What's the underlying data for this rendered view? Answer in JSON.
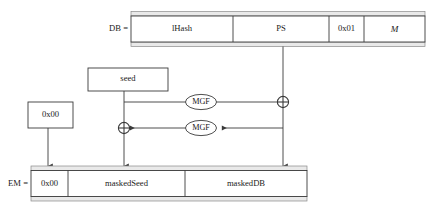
{
  "diagram": {
    "db_label": "DB =",
    "em_label": "EM =",
    "db_segments": [
      {
        "name": "lhash",
        "label": "lHash",
        "italic": false
      },
      {
        "name": "ps",
        "label": "PS",
        "italic": false
      },
      {
        "name": "byte01",
        "label": "0x01",
        "italic": false
      },
      {
        "name": "message",
        "label": "M",
        "italic": true
      }
    ],
    "em_segments": [
      {
        "name": "byte00",
        "label": "0x00",
        "italic": false
      },
      {
        "name": "maskedseed",
        "label": "maskedSeed",
        "italic": false
      },
      {
        "name": "maskeddb",
        "label": "maskedDB",
        "italic": false
      }
    ],
    "seed_box_label": "seed",
    "zero_box_label": "0x00",
    "mgf_upper_label": "MGF",
    "mgf_lower_label": "MGF",
    "xor_symbol": "⊕",
    "colors": {
      "stroke": "#3a3a3a",
      "fill": "#ffffff",
      "band": "#e9e9e9",
      "text": "#1a1a1a",
      "background": "#ffffff"
    }
  }
}
